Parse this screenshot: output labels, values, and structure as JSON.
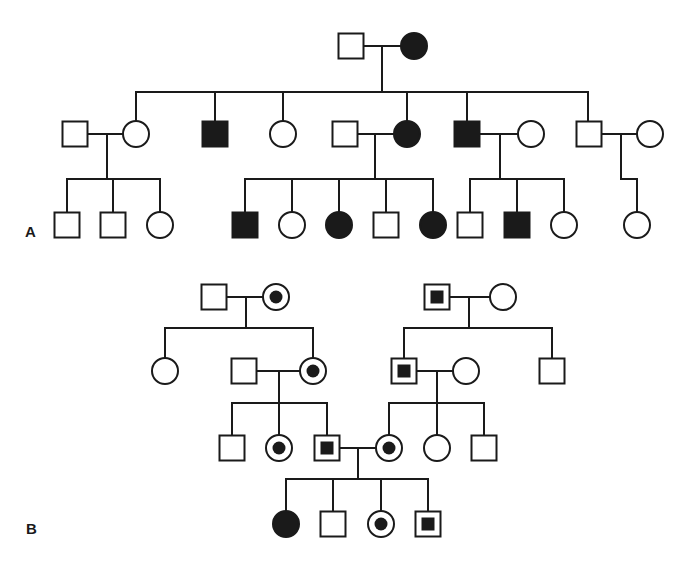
{
  "labels": {
    "panel_a": "A",
    "panel_b": "B"
  },
  "colors": {
    "line": "#1a1a1a",
    "fill": "#1a1a1a",
    "background": "#ffffff"
  },
  "legend_semantics": {
    "square": "male",
    "circle": "female",
    "affected": "filled",
    "unaffected": "open",
    "carrier": "open with central dot"
  },
  "pedigrees": {
    "A": {
      "nodes": [
        {
          "id": "A-I-1",
          "sex": "male",
          "status": "unaffected",
          "x": 351,
          "y": 46
        },
        {
          "id": "A-I-2",
          "sex": "female",
          "status": "affected",
          "x": 414,
          "y": 46
        },
        {
          "id": "A-II-1",
          "sex": "male",
          "status": "unaffected",
          "x": 75,
          "y": 134
        },
        {
          "id": "A-II-2",
          "sex": "female",
          "status": "unaffected",
          "x": 136,
          "y": 134
        },
        {
          "id": "A-II-3",
          "sex": "male",
          "status": "affected",
          "x": 215,
          "y": 134
        },
        {
          "id": "A-II-4",
          "sex": "female",
          "status": "unaffected",
          "x": 283,
          "y": 134
        },
        {
          "id": "A-II-5",
          "sex": "male",
          "status": "unaffected",
          "x": 345,
          "y": 134
        },
        {
          "id": "A-II-6",
          "sex": "female",
          "status": "affected",
          "x": 407,
          "y": 134
        },
        {
          "id": "A-II-7",
          "sex": "male",
          "status": "affected",
          "x": 467,
          "y": 134
        },
        {
          "id": "A-II-8",
          "sex": "female",
          "status": "unaffected",
          "x": 531,
          "y": 134
        },
        {
          "id": "A-II-9",
          "sex": "male",
          "status": "unaffected",
          "x": 589,
          "y": 134
        },
        {
          "id": "A-II-10",
          "sex": "female",
          "status": "unaffected",
          "x": 650,
          "y": 134
        },
        {
          "id": "A-III-1",
          "sex": "male",
          "status": "unaffected",
          "x": 67,
          "y": 225
        },
        {
          "id": "A-III-2",
          "sex": "male",
          "status": "unaffected",
          "x": 113,
          "y": 225
        },
        {
          "id": "A-III-3",
          "sex": "female",
          "status": "unaffected",
          "x": 160,
          "y": 225
        },
        {
          "id": "A-III-4",
          "sex": "male",
          "status": "affected",
          "x": 245,
          "y": 225
        },
        {
          "id": "A-III-5",
          "sex": "female",
          "status": "unaffected",
          "x": 292,
          "y": 225
        },
        {
          "id": "A-III-6",
          "sex": "female",
          "status": "affected",
          "x": 339,
          "y": 225
        },
        {
          "id": "A-III-7",
          "sex": "male",
          "status": "unaffected",
          "x": 386,
          "y": 225
        },
        {
          "id": "A-III-8",
          "sex": "female",
          "status": "affected",
          "x": 433,
          "y": 225
        },
        {
          "id": "A-III-9",
          "sex": "male",
          "status": "unaffected",
          "x": 470,
          "y": 225
        },
        {
          "id": "A-III-10",
          "sex": "male",
          "status": "affected",
          "x": 517,
          "y": 225
        },
        {
          "id": "A-III-11",
          "sex": "female",
          "status": "unaffected",
          "x": 564,
          "y": 225
        },
        {
          "id": "A-III-12",
          "sex": "female",
          "status": "unaffected",
          "x": 637,
          "y": 225
        }
      ]
    },
    "B": {
      "nodes": [
        {
          "id": "B-I-1",
          "sex": "male",
          "status": "unaffected",
          "x": 214,
          "y": 297
        },
        {
          "id": "B-I-2",
          "sex": "female",
          "status": "carrier",
          "x": 276,
          "y": 297
        },
        {
          "id": "B-I-3",
          "sex": "male",
          "status": "carrier",
          "x": 437,
          "y": 297
        },
        {
          "id": "B-I-4",
          "sex": "female",
          "status": "unaffected",
          "x": 503,
          "y": 297
        },
        {
          "id": "B-II-1",
          "sex": "female",
          "status": "unaffected",
          "x": 165,
          "y": 371
        },
        {
          "id": "B-II-2",
          "sex": "male",
          "status": "unaffected",
          "x": 244,
          "y": 371
        },
        {
          "id": "B-II-3",
          "sex": "female",
          "status": "carrier",
          "x": 313,
          "y": 371
        },
        {
          "id": "B-II-4",
          "sex": "male",
          "status": "carrier",
          "x": 404,
          "y": 371
        },
        {
          "id": "B-II-5",
          "sex": "female",
          "status": "unaffected",
          "x": 466,
          "y": 371
        },
        {
          "id": "B-II-6",
          "sex": "male",
          "status": "unaffected",
          "x": 552,
          "y": 371
        },
        {
          "id": "B-III-1",
          "sex": "male",
          "status": "unaffected",
          "x": 232,
          "y": 448
        },
        {
          "id": "B-III-2",
          "sex": "female",
          "status": "carrier",
          "x": 279,
          "y": 448
        },
        {
          "id": "B-III-3",
          "sex": "male",
          "status": "carrier",
          "x": 327,
          "y": 448
        },
        {
          "id": "B-III-4",
          "sex": "female",
          "status": "carrier",
          "x": 389,
          "y": 448
        },
        {
          "id": "B-III-5",
          "sex": "female",
          "status": "unaffected",
          "x": 437,
          "y": 448
        },
        {
          "id": "B-III-6",
          "sex": "male",
          "status": "unaffected",
          "x": 484,
          "y": 448
        },
        {
          "id": "B-IV-1",
          "sex": "female",
          "status": "affected",
          "x": 286,
          "y": 524
        },
        {
          "id": "B-IV-2",
          "sex": "male",
          "status": "unaffected",
          "x": 333,
          "y": 524
        },
        {
          "id": "B-IV-3",
          "sex": "female",
          "status": "carrier",
          "x": 381,
          "y": 524
        },
        {
          "id": "B-IV-4",
          "sex": "male",
          "status": "carrier",
          "x": 428,
          "y": 524
        }
      ]
    }
  },
  "lines": [
    [
      364,
      46,
      401,
      46
    ],
    [
      382,
      46,
      382,
      92
    ],
    [
      136,
      92,
      588,
      92
    ],
    [
      136,
      92,
      136,
      121
    ],
    [
      215,
      92,
      215,
      121
    ],
    [
      283,
      92,
      283,
      121
    ],
    [
      407,
      92,
      407,
      121
    ],
    [
      467,
      92,
      467,
      121
    ],
    [
      588,
      92,
      588,
      121
    ],
    [
      88,
      134,
      123,
      134
    ],
    [
      107,
      134,
      107,
      179
    ],
    [
      67,
      179,
      160,
      179
    ],
    [
      67,
      179,
      67,
      212
    ],
    [
      113,
      179,
      113,
      212
    ],
    [
      160,
      179,
      160,
      212
    ],
    [
      358,
      134,
      394,
      134
    ],
    [
      375,
      134,
      375,
      179
    ],
    [
      245,
      179,
      433,
      179
    ],
    [
      245,
      179,
      245,
      212
    ],
    [
      292,
      179,
      292,
      212
    ],
    [
      339,
      179,
      339,
      212
    ],
    [
      386,
      179,
      386,
      212
    ],
    [
      433,
      179,
      433,
      212
    ],
    [
      480,
      134,
      518,
      134
    ],
    [
      500,
      134,
      500,
      179
    ],
    [
      470,
      179,
      564,
      179
    ],
    [
      470,
      179,
      470,
      212
    ],
    [
      517,
      179,
      517,
      212
    ],
    [
      564,
      179,
      564,
      212
    ],
    [
      602,
      134,
      637,
      134
    ],
    [
      621,
      134,
      621,
      179
    ],
    [
      621,
      179,
      637,
      179
    ],
    [
      637,
      179,
      637,
      212
    ],
    [
      227,
      297,
      263,
      297
    ],
    [
      246,
      297,
      246,
      328
    ],
    [
      165,
      328,
      313,
      328
    ],
    [
      165,
      328,
      165,
      358
    ],
    [
      313,
      328,
      313,
      358
    ],
    [
      450,
      297,
      490,
      297
    ],
    [
      469,
      297,
      469,
      328
    ],
    [
      404,
      328,
      552,
      328
    ],
    [
      404,
      328,
      404,
      358
    ],
    [
      552,
      328,
      552,
      358
    ],
    [
      257,
      371,
      300,
      371
    ],
    [
      279,
      371,
      279,
      403
    ],
    [
      232,
      403,
      327,
      403
    ],
    [
      232,
      403,
      232,
      435
    ],
    [
      279,
      403,
      279,
      435
    ],
    [
      327,
      403,
      327,
      435
    ],
    [
      417,
      371,
      453,
      371
    ],
    [
      437,
      371,
      437,
      403
    ],
    [
      389,
      403,
      484,
      403
    ],
    [
      389,
      403,
      389,
      435
    ],
    [
      437,
      403,
      437,
      435
    ],
    [
      484,
      403,
      484,
      435
    ],
    [
      340,
      448,
      376,
      448
    ],
    [
      358,
      448,
      358,
      479
    ],
    [
      286,
      479,
      428,
      479
    ],
    [
      286,
      479,
      286,
      511
    ],
    [
      333,
      479,
      333,
      511
    ],
    [
      381,
      479,
      381,
      511
    ],
    [
      428,
      479,
      428,
      511
    ]
  ]
}
